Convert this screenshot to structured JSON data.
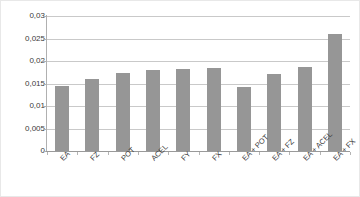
{
  "chart_data": {
    "type": "bar",
    "title": "",
    "subtitle": "",
    "xlabel": "",
    "ylabel": "",
    "categories": [
      "EA",
      "FZ",
      "POT",
      "ACEL",
      "FY",
      "FX",
      "EA + POT",
      "EA + FZ",
      "EA + ACEL",
      "EA + FX"
    ],
    "values": [
      0.0145,
      0.0159,
      0.0173,
      0.0181,
      0.0182,
      0.0184,
      0.0143,
      0.0172,
      0.0187,
      0.0261
    ],
    "ylim": [
      0,
      0.03
    ],
    "ytick_values": [
      0,
      0.005,
      0.01,
      0.015,
      0.02,
      0.025,
      0.03
    ],
    "ytick_labels": [
      "0",
      "0,005",
      "0,01",
      "0,015",
      "0,02",
      "0,025",
      "0,03"
    ],
    "grid": true,
    "grid_axis": "y",
    "legend": false,
    "legend_position": "none",
    "bar_color": "#969696",
    "gridline_color": "#c9c9c9",
    "axis_color": "#9a9a9a",
    "background_color": "#ffffff",
    "decimal_separator": ","
  }
}
